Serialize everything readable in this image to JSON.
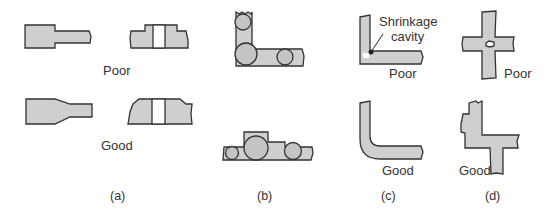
{
  "figure": {
    "panels": [
      {
        "id": "a",
        "caption": "(a)",
        "labels": {
          "poor": "Poor",
          "good": "Good"
        }
      },
      {
        "id": "b",
        "caption": "(b)"
      },
      {
        "id": "c",
        "caption": "(c)",
        "labels": {
          "poor": "Poor",
          "good": "Good"
        },
        "annotation": "Shrinkage cavity",
        "annotation_lines": [
          "Shrinkage",
          "cavity"
        ]
      },
      {
        "id": "d",
        "caption": "(d)",
        "labels": {
          "poor": "Poor",
          "good": "Good"
        }
      }
    ],
    "colors": {
      "fill": "#cfcfcf",
      "outline": "#333333",
      "background": "#ffffff"
    }
  }
}
